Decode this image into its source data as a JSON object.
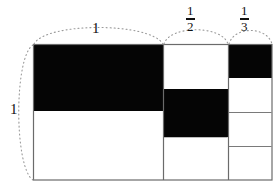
{
  "figure": {
    "background": "#ffffff",
    "fill_black": "#050505",
    "fill_white": "#ffffff",
    "stroke": "#6b6b6b",
    "dotted_stroke": "#9a9a9a",
    "text_color": "#111111"
  },
  "labels": {
    "width_whole": "1",
    "height_whole": "1",
    "half_numerator": "1",
    "half_denominator": "2",
    "third_numerator": "1",
    "third_denominator": "3"
  },
  "chart_data": {
    "type": "diagram",
    "units": "pixels",
    "outer_rect": {
      "x": 33,
      "y": 44,
      "width": 239,
      "height": 136
    },
    "columns": [
      {
        "name": "column-1",
        "label": "1",
        "x": 33,
        "width": 130
      },
      {
        "name": "column-2",
        "label": "1/2",
        "x": 163,
        "width": 65
      },
      {
        "name": "column-3",
        "label": "1/3",
        "x": 228,
        "width": 44
      }
    ],
    "cells": [
      {
        "name": "cell-left-top",
        "fill": "black",
        "x": 33,
        "y": 44,
        "width": 130,
        "height": 67
      },
      {
        "name": "cell-left-bottom",
        "fill": "white",
        "x": 33,
        "y": 111,
        "width": 130,
        "height": 69
      },
      {
        "name": "cell-mid-top",
        "fill": "white",
        "x": 163,
        "y": 44,
        "width": 65,
        "height": 45
      },
      {
        "name": "cell-mid-middle",
        "fill": "black",
        "x": 163,
        "y": 89,
        "width": 65,
        "height": 48
      },
      {
        "name": "cell-mid-bottom",
        "fill": "white",
        "x": 163,
        "y": 137,
        "width": 65,
        "height": 43
      },
      {
        "name": "cell-right-r1",
        "fill": "black",
        "x": 228,
        "y": 44,
        "width": 44,
        "height": 34
      },
      {
        "name": "cell-right-r2",
        "fill": "white",
        "x": 228,
        "y": 78,
        "width": 44,
        "height": 34
      },
      {
        "name": "cell-right-r3",
        "fill": "white",
        "x": 228,
        "y": 112,
        "width": 44,
        "height": 34
      },
      {
        "name": "cell-right-r4",
        "fill": "white",
        "x": 228,
        "y": 146,
        "width": 44,
        "height": 34
      }
    ],
    "dimension_arcs": [
      {
        "name": "arc-width-1",
        "label": "1",
        "from_x": 33,
        "to_x": 163,
        "side": "top"
      },
      {
        "name": "arc-half",
        "label": "1/2",
        "from_x": 163,
        "to_x": 228,
        "side": "top"
      },
      {
        "name": "arc-third",
        "label": "1/3",
        "from_x": 228,
        "to_x": 272,
        "side": "top"
      },
      {
        "name": "arc-height-1",
        "label": "1",
        "from_y": 44,
        "to_y": 180,
        "side": "left"
      }
    ]
  }
}
